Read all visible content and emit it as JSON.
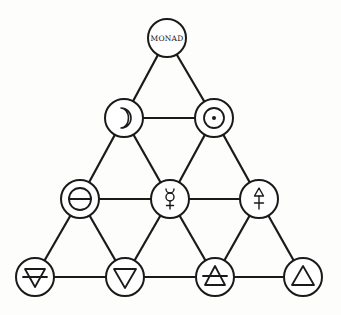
{
  "diagram": {
    "type": "triangular-tetractys",
    "nodes": [
      {
        "id": "monad",
        "label": "Monad",
        "display": "MONAD",
        "symbol": "text",
        "row": 1,
        "cx": 167,
        "cy": 38
      },
      {
        "id": "moon",
        "label": "Moon",
        "symbol": "moon-icon",
        "row": 2,
        "cx": 124,
        "cy": 118
      },
      {
        "id": "sun",
        "label": "Sun",
        "symbol": "sun-icon",
        "row": 2,
        "cx": 214,
        "cy": 118
      },
      {
        "id": "salt",
        "label": "Salt",
        "symbol": "salt-icon",
        "row": 3,
        "cx": 80,
        "cy": 199
      },
      {
        "id": "mercury",
        "label": "Mercury",
        "symbol": "mercury-icon",
        "row": 3,
        "cx": 170,
        "cy": 199
      },
      {
        "id": "sulfur",
        "label": "Sulfur",
        "symbol": "sulfur-icon",
        "row": 3,
        "cx": 259,
        "cy": 199
      },
      {
        "id": "earth",
        "label": "Earth",
        "symbol": "earth-icon",
        "row": 4,
        "cx": 35,
        "cy": 277
      },
      {
        "id": "water",
        "label": "Water",
        "symbol": "water-icon",
        "row": 4,
        "cx": 125,
        "cy": 277
      },
      {
        "id": "air",
        "label": "Air",
        "symbol": "air-icon",
        "row": 4,
        "cx": 215,
        "cy": 277
      },
      {
        "id": "fire",
        "label": "Fire",
        "symbol": "fire-icon",
        "row": 4,
        "cx": 303,
        "cy": 277
      }
    ],
    "edges": [
      [
        "monad",
        "moon"
      ],
      [
        "monad",
        "sun"
      ],
      [
        "moon",
        "sun"
      ],
      [
        "moon",
        "salt"
      ],
      [
        "moon",
        "mercury"
      ],
      [
        "sun",
        "mercury"
      ],
      [
        "sun",
        "sulfur"
      ],
      [
        "salt",
        "mercury"
      ],
      [
        "mercury",
        "sulfur"
      ],
      [
        "salt",
        "earth"
      ],
      [
        "salt",
        "water"
      ],
      [
        "mercury",
        "water"
      ],
      [
        "mercury",
        "air"
      ],
      [
        "sulfur",
        "air"
      ],
      [
        "sulfur",
        "fire"
      ],
      [
        "earth",
        "water"
      ],
      [
        "water",
        "air"
      ],
      [
        "air",
        "fire"
      ]
    ],
    "node_radius": 19,
    "colors": {
      "stroke": "#1a1a1a",
      "node_fill": "#ffffff",
      "background": "#fdfdfb"
    }
  }
}
